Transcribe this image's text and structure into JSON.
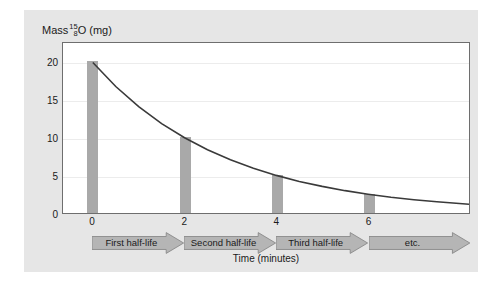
{
  "chart_data": {
    "type": "bar",
    "title": "",
    "ylabel_text": "Mass",
    "ylabel_mass_number": "15",
    "ylabel_atomic_number": "8",
    "ylabel_element": "O",
    "ylabel_units": "(mg)",
    "xlabel": "Time (minutes)",
    "categories": [
      0,
      2,
      4,
      6
    ],
    "values": [
      20,
      10,
      5,
      2.5
    ],
    "x_tick_labels": [
      "0",
      "2",
      "4",
      "6"
    ],
    "y_tick_labels": [
      "0",
      "5",
      "10",
      "15",
      "20"
    ],
    "y_tick_values": [
      0,
      5,
      10,
      15,
      20
    ],
    "xlim": [
      -0.65,
      8.2
    ],
    "ylim": [
      0,
      22.6
    ],
    "grid": true,
    "legend": "none",
    "series": [
      {
        "name": "Mass of oxygen-15 (mg)",
        "type": "bar",
        "values": [
          20,
          10,
          5,
          2.5
        ],
        "color": "#a9a9a9"
      },
      {
        "name": "Exponential decay curve",
        "type": "line",
        "color": "#3a3a3a",
        "half_life_minutes": 2,
        "initial_mass": 20,
        "points": [
          {
            "x": 0,
            "y": 20
          },
          {
            "x": 0.5,
            "y": 16.82
          },
          {
            "x": 1,
            "y": 14.14
          },
          {
            "x": 1.5,
            "y": 11.89
          },
          {
            "x": 2,
            "y": 10
          },
          {
            "x": 2.5,
            "y": 8.41
          },
          {
            "x": 3,
            "y": 7.07
          },
          {
            "x": 3.5,
            "y": 5.95
          },
          {
            "x": 4,
            "y": 5
          },
          {
            "x": 4.5,
            "y": 4.2
          },
          {
            "x": 5,
            "y": 3.54
          },
          {
            "x": 5.5,
            "y": 2.97
          },
          {
            "x": 6,
            "y": 2.5
          },
          {
            "x": 6.5,
            "y": 2.1
          },
          {
            "x": 7,
            "y": 1.77
          },
          {
            "x": 7.5,
            "y": 1.49
          },
          {
            "x": 8.2,
            "y": 1.17
          }
        ]
      }
    ],
    "annotations": {
      "half_life_arrows": [
        {
          "label": "First half-life",
          "start": 0,
          "end": 2
        },
        {
          "label": "Second half-life",
          "start": 2,
          "end": 4
        },
        {
          "label": "Third half-life",
          "start": 4,
          "end": 6
        },
        {
          "label": "etc.",
          "start": 6,
          "end": 8.2
        }
      ]
    },
    "colors": {
      "bar": "#a9a9a9",
      "curve": "#3a3a3a",
      "panel_background": "#e6e6e6",
      "plot_background": "#ffffff",
      "frame": "#6e6e6e",
      "gridline": "#ececec",
      "arrow_fill": "#b5b5b5",
      "arrow_stroke": "#8a8a8a",
      "text": "#1a1a1a"
    }
  }
}
